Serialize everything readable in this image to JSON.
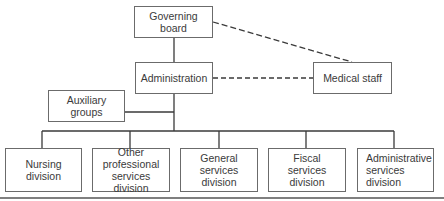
{
  "diagram": {
    "type": "organizational-chart",
    "nodes": {
      "governing_board": "Governing board",
      "administration": "Administration",
      "medical_staff": "Medical staff",
      "auxiliary_groups": "Auxiliary\ngroups",
      "nursing_division": "Nursing\ndivision",
      "other_professional": "Other\nprofessional\nservices division",
      "general_services": "General\nservices\ndivision",
      "fiscal_services": "Fiscal\nservices\ndivision",
      "administrative_services": "Administrative\nservices\ndivision"
    },
    "edges": [
      {
        "from": "Governing board",
        "to": "Administration",
        "style": "solid"
      },
      {
        "from": "Governing board",
        "to": "Medical staff",
        "style": "dashed"
      },
      {
        "from": "Administration",
        "to": "Medical staff",
        "style": "dashed"
      },
      {
        "from": "Administration",
        "to": "Auxiliary groups",
        "style": "solid"
      },
      {
        "from": "Administration",
        "to": "Nursing division",
        "style": "solid"
      },
      {
        "from": "Administration",
        "to": "Other professional services division",
        "style": "solid"
      },
      {
        "from": "Administration",
        "to": "General services division",
        "style": "solid"
      },
      {
        "from": "Administration",
        "to": "Fiscal services division",
        "style": "solid"
      },
      {
        "from": "Administration",
        "to": "Administrative services division",
        "style": "solid"
      }
    ],
    "colors": {
      "line": "#3a3a3a",
      "border": "#6b6b6b",
      "background": "#ffffff"
    }
  }
}
